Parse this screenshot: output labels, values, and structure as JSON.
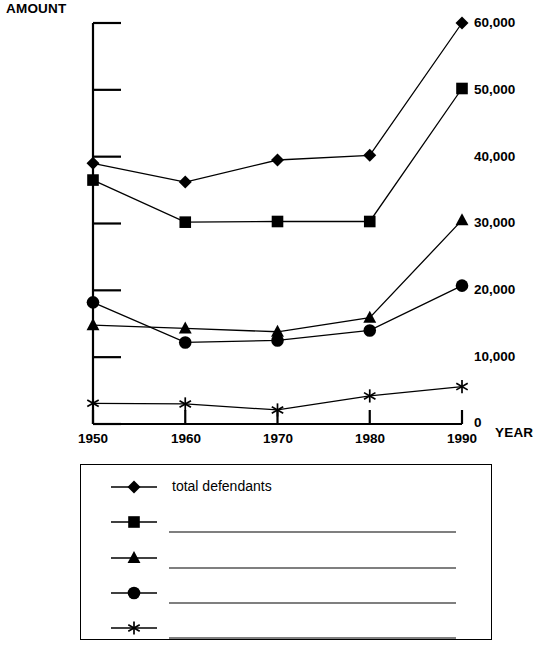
{
  "chart_data": {
    "type": "line",
    "title": "",
    "xlabel": "YEAR",
    "ylabel": "AMOUNT",
    "x": [
      1950,
      1960,
      1970,
      1980,
      1990
    ],
    "categories": [
      "1950",
      "1960",
      "1970",
      "1980",
      "1990"
    ],
    "xlim": [
      1950,
      1990
    ],
    "ylim": [
      0,
      60000
    ],
    "ytick_values": [
      0,
      10000,
      20000,
      30000,
      40000,
      50000,
      60000
    ],
    "ytick_labels": [
      "0",
      "10,000",
      "20,000",
      "30,000",
      "40,000",
      "50,000",
      "60,000"
    ],
    "grid": false,
    "legend_position": "below-plot",
    "series": [
      {
        "name": "total defendants",
        "marker": "diamond",
        "values": [
          39000,
          36200,
          39500,
          40200,
          60000
        ]
      },
      {
        "name": "",
        "marker": "square",
        "values": [
          36500,
          30200,
          30300,
          30300,
          50200
        ]
      },
      {
        "name": "",
        "marker": "triangle",
        "values": [
          14800,
          14300,
          13800,
          15900,
          30500
        ]
      },
      {
        "name": "",
        "marker": "circle",
        "values": [
          18200,
          12200,
          12500,
          14000,
          20700
        ]
      },
      {
        "name": "",
        "marker": "asterisk",
        "values": [
          3100,
          3000,
          2100,
          4200,
          5600
        ]
      }
    ]
  },
  "axes": {
    "amount_label": "AMOUNT",
    "year_label": "YEAR"
  },
  "legend": {
    "entries": [
      {
        "marker": "diamond",
        "label": "total defendants",
        "has_blank_line": false
      },
      {
        "marker": "square",
        "label": "",
        "has_blank_line": true
      },
      {
        "marker": "triangle",
        "label": "",
        "has_blank_line": true
      },
      {
        "marker": "circle",
        "label": "",
        "has_blank_line": true
      },
      {
        "marker": "asterisk",
        "label": "",
        "has_blank_line": true
      }
    ]
  },
  "colors": {
    "ink": "#000000",
    "background": "#ffffff"
  }
}
